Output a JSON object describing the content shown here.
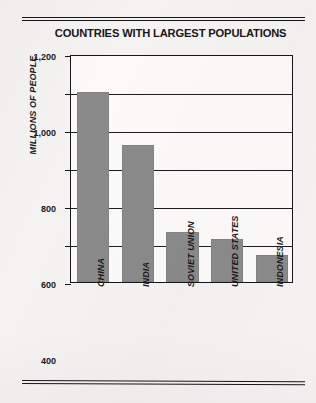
{
  "chart_data": {
    "type": "bar",
    "title": "COUNTRIES WITH LARGEST POPULATIONS",
    "xlabel": "",
    "ylabel": "MILLIONS OF PEOPLE",
    "categories": [
      "CHINA",
      "INDIA",
      "SOVIET UNION",
      "UNITED STATES",
      "INDONESIA"
    ],
    "values": [
      1000,
      720,
      265,
      225,
      140
    ],
    "ylim": [
      0,
      1200
    ],
    "yticks": [
      0,
      200,
      400,
      600,
      800,
      1000,
      1200
    ],
    "ytick_labels": [
      "0",
      "200",
      "400",
      "600",
      "800",
      "1,000",
      "1,200"
    ],
    "grid": true,
    "legend": false,
    "bar_color": "#8a8a8a",
    "axis_color": "#17171a",
    "background_color": "#f4f3f1"
  },
  "figure": {
    "rule_top_label": "top-double-rule",
    "rule_bottom_label": "bottom-double-rule"
  }
}
